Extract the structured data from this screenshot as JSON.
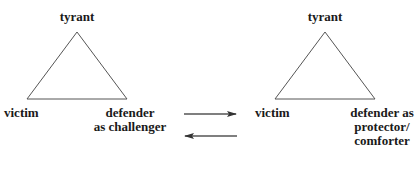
{
  "diagram": {
    "left_triangle": {
      "top_label": "tyrant",
      "left_label": "victim",
      "right_label": "defender\nas challenger"
    },
    "right_triangle": {
      "top_label": "tyrant",
      "left_label": "victim",
      "right_label": "defender as\nprotector/\ncomforter"
    },
    "arrows": [
      {
        "direction": "right",
        "meaning": "left-to-right transition"
      },
      {
        "direction": "left",
        "meaning": "right-to-left transition"
      }
    ],
    "colors": {
      "line": "#555555",
      "arrow": "#333333",
      "text": "#1a1a1a"
    }
  }
}
